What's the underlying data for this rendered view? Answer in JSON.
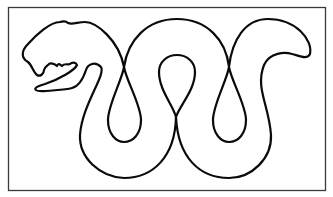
{
  "figure": {
    "frame": {
      "stroke_color": "#3a3a3a"
    },
    "outline": {
      "stroke_color": "#0a0a0a",
      "fill": "#ffffff"
    },
    "background": "#ffffff"
  }
}
